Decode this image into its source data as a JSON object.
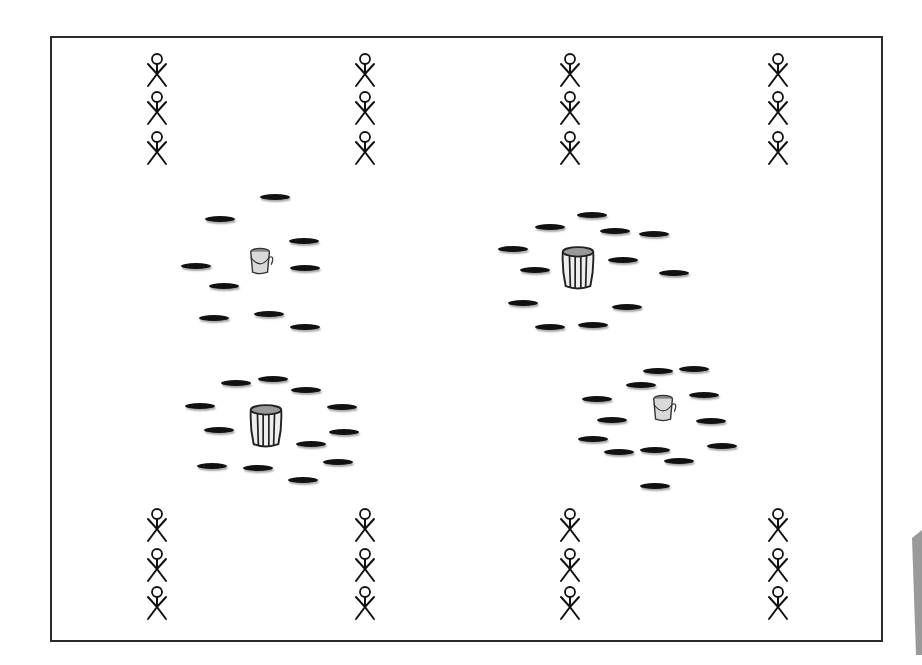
{
  "diagram": {
    "title": "",
    "field": {
      "x": 50,
      "y": 36,
      "width": 831,
      "height": 604,
      "border_color": "#2a2a2a"
    },
    "colors": {
      "spot": "#111111",
      "figure": "#111111",
      "bucket_fill": "#d9d9d9",
      "bucket_stroke": "#333333"
    },
    "players": {
      "icon": "stick-figure-icon",
      "columns_x": [
        157,
        365,
        570,
        778
      ],
      "top_rows_y": [
        70,
        108,
        148
      ],
      "bottom_rows_y": [
        525,
        565,
        603
      ]
    },
    "stations": [
      {
        "name": "station-top-left",
        "container": {
          "type": "small-bucket",
          "icon": "bucket-icon",
          "x": 261,
          "y": 263
        },
        "spots": [
          [
            275,
            197
          ],
          [
            220,
            219
          ],
          [
            304,
            241
          ],
          [
            196,
            266
          ],
          [
            305,
            268
          ],
          [
            224,
            286
          ],
          [
            214,
            318
          ],
          [
            269,
            314
          ],
          [
            305,
            327
          ]
        ]
      },
      {
        "name": "station-top-right",
        "container": {
          "type": "large-barrel",
          "icon": "barrel-icon",
          "x": 578,
          "y": 270
        },
        "spots": [
          [
            592,
            215
          ],
          [
            550,
            227
          ],
          [
            615,
            231
          ],
          [
            654,
            234
          ],
          [
            513,
            249
          ],
          [
            623,
            260
          ],
          [
            535,
            270
          ],
          [
            674,
            273
          ],
          [
            523,
            303
          ],
          [
            627,
            307
          ],
          [
            550,
            327
          ],
          [
            593,
            325
          ]
        ]
      },
      {
        "name": "station-bottom-left",
        "container": {
          "type": "large-barrel",
          "icon": "barrel-icon",
          "x": 266,
          "y": 428
        },
        "spots": [
          [
            236,
            383
          ],
          [
            273,
            379
          ],
          [
            306,
            390
          ],
          [
            200,
            406
          ],
          [
            342,
            407
          ],
          [
            219,
            430
          ],
          [
            344,
            432
          ],
          [
            311,
            444
          ],
          [
            212,
            466
          ],
          [
            258,
            468
          ],
          [
            338,
            462
          ],
          [
            303,
            480
          ]
        ]
      },
      {
        "name": "station-bottom-right",
        "container": {
          "type": "small-bucket",
          "icon": "bucket-icon",
          "x": 664,
          "y": 410
        },
        "spots": [
          [
            658,
            371
          ],
          [
            694,
            369
          ],
          [
            641,
            385
          ],
          [
            597,
            399
          ],
          [
            704,
            395
          ],
          [
            612,
            420
          ],
          [
            711,
            421
          ],
          [
            593,
            439
          ],
          [
            619,
            452
          ],
          [
            655,
            450
          ],
          [
            722,
            446
          ],
          [
            679,
            461
          ],
          [
            655,
            486
          ]
        ]
      }
    ]
  }
}
